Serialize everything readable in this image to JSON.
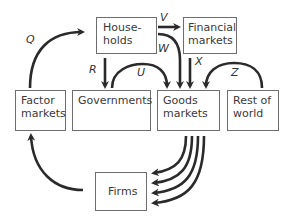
{
  "nodes": {
    "households": "House-\nholds",
    "financial_markets": "Financial\nmarkets",
    "factor_markets": "Factor\nmarkets",
    "governments": "Governments",
    "goods_markets": "Goods\nmarkets",
    "rest_of_world": "Rest of\nworld",
    "firms": "Firms"
  },
  "flow_labels": {
    "q": "Q",
    "r": "R",
    "u": "U",
    "v": "V",
    "w": "W",
    "x": "X",
    "z": "Z"
  },
  "colors": {
    "arrow": "#2a2a2a",
    "box_border": "#6d6d6d"
  }
}
